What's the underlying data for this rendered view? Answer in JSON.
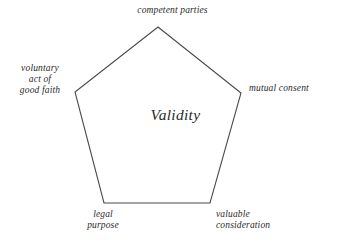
{
  "diagram": {
    "type": "pentagon-concept-diagram",
    "center_label": "Validity",
    "stroke_color": "#4a4a4a",
    "background_color": "#ffffff",
    "text_color": "#2b2b2b",
    "vertices": [
      {
        "id": "top",
        "label": "competent parties",
        "x": 158,
        "y": 27
      },
      {
        "id": "right",
        "label": "mutual consent",
        "x": 241,
        "y": 93
      },
      {
        "id": "bottom-right",
        "label": "valuable\nconsideration",
        "x": 210,
        "y": 203
      },
      {
        "id": "bottom-left",
        "label": "legal\npurpose",
        "x": 104,
        "y": 203
      },
      {
        "id": "left",
        "label": "voluntary\nact of\ngood faith",
        "x": 75,
        "y": 92
      }
    ],
    "labels": {
      "top": "competent parties",
      "left": "voluntary\nact of\ngood faith",
      "right": "mutual consent",
      "bottom_left": "legal\npurpose",
      "bottom_right": "valuable\nconsideration",
      "center": "Validity"
    }
  }
}
